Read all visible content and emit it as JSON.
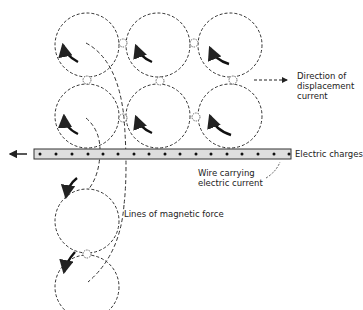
{
  "diagram": {
    "labels": {
      "displacement_line1": "Direction of",
      "displacement_line2": "displacement",
      "displacement_line3": "current",
      "electric_charges": "Electric charges",
      "wire_line1": "Wire carrying",
      "wire_line2": "electric current",
      "magnetic_force": "Lines of magnetic force"
    },
    "elements": {
      "vortices": [
        {
          "row": 1,
          "col": 1,
          "cx": 87,
          "cy": 45
        },
        {
          "row": 1,
          "col": 2,
          "cx": 158,
          "cy": 45
        },
        {
          "row": 1,
          "col": 3,
          "cx": 230,
          "cy": 45
        },
        {
          "row": 2,
          "col": 1,
          "cx": 87,
          "cy": 116
        },
        {
          "row": 2,
          "col": 2,
          "cx": 158,
          "cy": 116
        },
        {
          "row": 2,
          "col": 3,
          "cx": 230,
          "cy": 116
        },
        {
          "row": 3,
          "col": 1,
          "cx": 87,
          "cy": 222
        },
        {
          "row": 4,
          "col": 1,
          "cx": 87,
          "cy": 287
        }
      ],
      "vortex_radius": 32,
      "wire": {
        "x1": 34,
        "x2": 290,
        "y_top": 148,
        "y_bottom": 159,
        "charge_count": 17
      },
      "colors": {
        "stroke": "#333333",
        "wire_fill": "#dcdcdc"
      }
    }
  }
}
